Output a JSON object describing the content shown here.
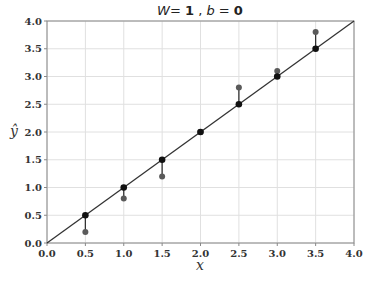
{
  "chart_data": {
    "type": "scatter",
    "title_parts": {
      "w_label": "W",
      "w_eq": "= ",
      "w_val": "1",
      "sep": " , ",
      "b_label": "b",
      "b_eq": " = ",
      "b_val": "0"
    },
    "xlabel": "x",
    "ylabel": "ŷ",
    "xlim": [
      0.0,
      4.0
    ],
    "ylim": [
      0.0,
      4.0
    ],
    "xticks": [
      "0.0",
      "0.5",
      "1.0",
      "1.5",
      "2.0",
      "2.5",
      "3.0",
      "3.5",
      "4.0"
    ],
    "yticks": [
      "0.0",
      "0.5",
      "1.0",
      "1.5",
      "2.0",
      "2.5",
      "3.0",
      "3.5",
      "4.0"
    ],
    "grid": true,
    "legend": null,
    "series": [
      {
        "name": "prediction line",
        "kind": "line",
        "x": [
          0.0,
          4.0
        ],
        "y": [
          0.0,
          4.0
        ],
        "color": "#333333"
      },
      {
        "name": "predicted",
        "kind": "points",
        "x": [
          0.5,
          1.0,
          1.5,
          2.0,
          2.5,
          3.0,
          3.5
        ],
        "y": [
          0.5,
          1.0,
          1.5,
          2.0,
          2.5,
          3.0,
          3.5
        ],
        "color": "#111111"
      },
      {
        "name": "actual",
        "kind": "points",
        "x": [
          0.5,
          1.0,
          1.5,
          2.0,
          2.5,
          3.0,
          3.5
        ],
        "y": [
          0.2,
          0.8,
          1.2,
          2.0,
          2.8,
          3.1,
          3.8
        ],
        "color": "#555555"
      }
    ]
  },
  "colors": {
    "grid": "#e0e0e0",
    "axes": "#888888",
    "line": "#333333",
    "predicted": "#111111",
    "actual": "#5a5a5a"
  }
}
